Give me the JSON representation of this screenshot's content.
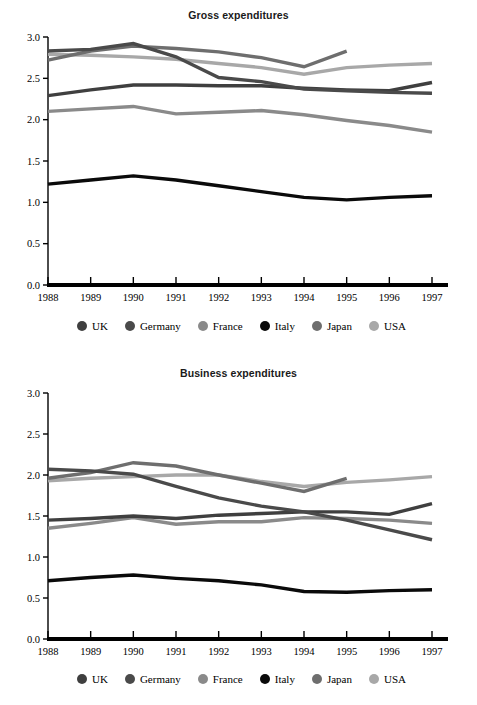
{
  "figure": {
    "background": "#ffffff",
    "axis_color": "#000000",
    "panels": [
      "gross",
      "business"
    ]
  },
  "legend": {
    "items": [
      {
        "label": "UK",
        "color": "#3f3f3f"
      },
      {
        "label": "Germany",
        "color": "#4a4a4a"
      },
      {
        "label": "France",
        "color": "#8a8a8a"
      },
      {
        "label": "Italy",
        "color": "#0a0a0a"
      },
      {
        "label": "Japan",
        "color": "#6e6e6e"
      },
      {
        "label": "USA",
        "color": "#a8a8a8"
      }
    ]
  },
  "chart_data": [
    {
      "type": "line",
      "title": "Gross expenditures",
      "xlabel": "",
      "ylabel": "",
      "x": [
        1988,
        1989,
        1990,
        1991,
        1992,
        1993,
        1994,
        1995,
        1996,
        1997
      ],
      "xtick_labels": [
        "1988",
        "1989",
        "1990",
        "1991",
        "1992",
        "1993",
        "1994",
        "1995",
        "1996",
        "1997"
      ],
      "ytick_labels": [
        "0.0",
        "0.5",
        "1.0",
        "1.5",
        "2.0",
        "2.5",
        "3.0"
      ],
      "yticks": [
        0.0,
        0.5,
        1.0,
        1.5,
        2.0,
        2.5,
        3.0
      ],
      "ylim": [
        0.0,
        3.0
      ],
      "grid": false,
      "legend_position": "bottom",
      "series": [
        {
          "name": "UK",
          "color": "#3f3f3f",
          "values": [
            2.29,
            2.36,
            2.42,
            2.42,
            2.41,
            2.41,
            2.38,
            2.36,
            2.35,
            2.45
          ]
        },
        {
          "name": "Germany",
          "color": "#4a4a4a",
          "values": [
            2.83,
            2.85,
            2.92,
            2.76,
            2.51,
            2.46,
            2.37,
            2.35,
            2.33,
            2.32
          ]
        },
        {
          "name": "France",
          "color": "#8a8a8a",
          "values": [
            2.1,
            2.13,
            2.16,
            2.07,
            2.09,
            2.11,
            2.06,
            1.99,
            1.93,
            1.85
          ]
        },
        {
          "name": "Italy",
          "color": "#0a0a0a",
          "values": [
            1.22,
            1.27,
            1.32,
            1.27,
            1.2,
            1.13,
            1.06,
            1.03,
            1.06,
            1.08
          ]
        },
        {
          "name": "Japan",
          "color": "#6e6e6e",
          "values": [
            2.72,
            2.83,
            2.89,
            2.86,
            2.82,
            2.75,
            2.64,
            2.83,
            null,
            null
          ]
        },
        {
          "name": "USA",
          "color": "#a8a8a8",
          "values": [
            2.79,
            2.78,
            2.76,
            2.73,
            2.68,
            2.63,
            2.55,
            2.63,
            2.66,
            2.68
          ]
        }
      ]
    },
    {
      "type": "line",
      "title": "Business expenditures",
      "xlabel": "",
      "ylabel": "",
      "x": [
        1988,
        1989,
        1990,
        1991,
        1992,
        1993,
        1994,
        1995,
        1996,
        1997
      ],
      "xtick_labels": [
        "1988",
        "1989",
        "1990",
        "1991",
        "1992",
        "1993",
        "1994",
        "1995",
        "1996",
        "1997"
      ],
      "ytick_labels": [
        "0.0",
        "0.5",
        "1.0",
        "1.5",
        "2.0",
        "2.5",
        "3.0"
      ],
      "yticks": [
        0.0,
        0.5,
        1.0,
        1.5,
        2.0,
        2.5,
        3.0
      ],
      "ylim": [
        0.0,
        3.0
      ],
      "grid": false,
      "legend_position": "bottom",
      "series": [
        {
          "name": "UK",
          "color": "#3f3f3f",
          "values": [
            1.45,
            1.47,
            1.5,
            1.47,
            1.51,
            1.53,
            1.55,
            1.55,
            1.52,
            1.65
          ]
        },
        {
          "name": "Germany",
          "color": "#4a4a4a",
          "values": [
            2.07,
            2.05,
            2.01,
            1.86,
            1.72,
            1.62,
            1.55,
            1.45,
            1.33,
            1.21
          ]
        },
        {
          "name": "France",
          "color": "#8a8a8a",
          "values": [
            1.42,
            1.45,
            1.48,
            1.4,
            1.43,
            1.43,
            1.48,
            1.47,
            1.45,
            1.41
          ]
        },
        {
          "name": "Italy",
          "color": "#0a0a0a",
          "values": [
            0.71,
            0.75,
            0.78,
            0.74,
            0.71,
            0.66,
            0.58,
            0.57,
            0.59,
            0.6
          ]
        },
        {
          "name": "Japan",
          "color": "#6e6e6e",
          "values": [
            1.96,
            2.03,
            2.15,
            2.11,
            2.0,
            1.9,
            1.8,
            1.96,
            null,
            null
          ]
        },
        {
          "name": "USA",
          "color": "#a8a8a8",
          "values": [
            1.93,
            1.96,
            1.98,
            2.0,
            2.0,
            1.92,
            1.86,
            1.91,
            1.94,
            1.98
          ]
        }
      ]
    },
    {
      "type": "line",
      "title": "Business expenditures (france-lower)",
      "x": [
        1988,
        1989,
        1990
      ],
      "series": [
        {
          "name": "France-start",
          "color": "#8a8a8a",
          "values": [
            1.35,
            1.41,
            1.48
          ]
        }
      ]
    }
  ]
}
